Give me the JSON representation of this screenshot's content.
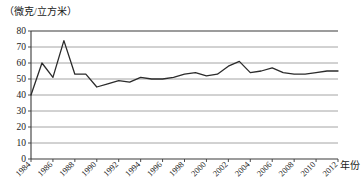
{
  "chart_data": {
    "type": "line",
    "title": "",
    "subtitle": "",
    "unit_label": "（微克/立方米）",
    "xlabel": "年份",
    "ylabel": "",
    "ylim": [
      0,
      80
    ],
    "xlim": [
      1984,
      2012
    ],
    "ytick_labels": [
      "80",
      "70",
      "60",
      "50",
      "40",
      "30",
      "20",
      "10",
      "0"
    ],
    "ytick_values": [
      80,
      70,
      60,
      50,
      40,
      30,
      20,
      10,
      0
    ],
    "xtick_labels": [
      "1984",
      "1986",
      "1988",
      "1990",
      "1992",
      "1994",
      "1996",
      "1998",
      "2000",
      "2002",
      "2004",
      "2006",
      "2008",
      "2010",
      "2012"
    ],
    "xtick_values": [
      1984,
      1986,
      1988,
      1990,
      1992,
      1994,
      1996,
      1998,
      2000,
      2002,
      2004,
      2006,
      2008,
      2010,
      2012
    ],
    "grid": true,
    "legend": "none",
    "x": [
      1984,
      1985,
      1986,
      1987,
      1988,
      1989,
      1990,
      1991,
      1992,
      1993,
      1994,
      1995,
      1996,
      1997,
      1998,
      1999,
      2000,
      2001,
      2002,
      2003,
      2004,
      2005,
      2006,
      2007,
      2008,
      2009,
      2010,
      2011,
      2012
    ],
    "values": [
      40,
      60,
      51,
      74,
      53,
      53,
      45,
      47,
      49,
      48,
      51,
      50,
      50,
      51,
      53,
      54,
      52,
      53,
      58,
      61,
      54,
      55,
      57,
      54,
      53,
      53,
      54,
      55,
      55
    ],
    "series": [
      {
        "name": "浓度",
        "values": [
          40,
          60,
          51,
          74,
          53,
          53,
          45,
          47,
          49,
          48,
          51,
          50,
          50,
          51,
          53,
          54,
          52,
          53,
          58,
          61,
          54,
          55,
          57,
          54,
          53,
          53,
          54,
          55,
          55
        ]
      }
    ],
    "line_color": "#2b2b2b",
    "grid_color": "#9a9a9a",
    "axis_color": "#3a3a3a",
    "background_color": "#ffffff"
  }
}
